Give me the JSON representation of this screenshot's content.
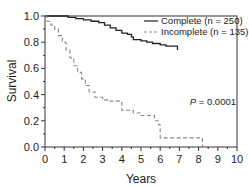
{
  "chart_data": {
    "type": "line",
    "subtype": "kaplan-meier step",
    "title": "",
    "xlabel": "Years",
    "ylabel": "Survival",
    "xlim": [
      0,
      10
    ],
    "ylim": [
      0.0,
      1.0
    ],
    "x_ticks": [
      "0",
      "1",
      "2",
      "3",
      "4",
      "5",
      "6",
      "7",
      "8",
      "9",
      "10"
    ],
    "y_ticks": [
      "0.0",
      "0.2",
      "0.4",
      "0.6",
      "0.8",
      "1.0"
    ],
    "grid": false,
    "legend_position": "upper right",
    "annotation": "P = 0.0001",
    "series": [
      {
        "name": "Complete (n = 250)",
        "style": "solid",
        "color": "#222222",
        "points": [
          [
            0,
            1.0
          ],
          [
            0.9,
            1.0
          ],
          [
            1.2,
            0.99
          ],
          [
            1.6,
            0.98
          ],
          [
            2.0,
            0.97
          ],
          [
            2.4,
            0.96
          ],
          [
            2.8,
            0.95
          ],
          [
            3.1,
            0.93
          ],
          [
            3.4,
            0.91
          ],
          [
            3.7,
            0.89
          ],
          [
            4.0,
            0.87
          ],
          [
            4.3,
            0.86
          ],
          [
            4.5,
            0.84
          ],
          [
            4.6,
            0.82
          ],
          [
            5.0,
            0.81
          ],
          [
            5.3,
            0.8
          ],
          [
            5.6,
            0.79
          ],
          [
            6.0,
            0.78
          ],
          [
            6.3,
            0.77
          ],
          [
            6.9,
            0.77
          ],
          [
            6.9,
            0.74
          ]
        ]
      },
      {
        "name": "Incomplete (n = 135)",
        "style": "dashed",
        "color": "#888888",
        "points": [
          [
            0,
            1.0
          ],
          [
            0.1,
            0.96
          ],
          [
            0.3,
            0.93
          ],
          [
            0.5,
            0.9
          ],
          [
            0.7,
            0.85
          ],
          [
            0.9,
            0.8
          ],
          [
            1.1,
            0.74
          ],
          [
            1.3,
            0.68
          ],
          [
            1.5,
            0.62
          ],
          [
            1.7,
            0.57
          ],
          [
            1.9,
            0.52
          ],
          [
            2.1,
            0.47
          ],
          [
            2.3,
            0.42
          ],
          [
            2.6,
            0.38
          ],
          [
            3.0,
            0.36
          ],
          [
            3.4,
            0.35
          ],
          [
            3.9,
            0.34
          ],
          [
            4.0,
            0.28
          ],
          [
            4.4,
            0.28
          ],
          [
            4.6,
            0.26
          ],
          [
            5.0,
            0.24
          ],
          [
            5.6,
            0.24
          ],
          [
            5.7,
            0.2
          ],
          [
            5.9,
            0.17
          ],
          [
            6.0,
            0.07
          ],
          [
            8.2,
            0.07
          ],
          [
            8.2,
            0.0
          ]
        ]
      }
    ]
  },
  "legend": {
    "items": [
      {
        "label": "Complete (n = 250)",
        "style": "solid"
      },
      {
        "label": "Incomplete (n = 135)",
        "style": "dashed"
      }
    ]
  },
  "labels": {
    "xlabel": "Years",
    "ylabel": "Survival",
    "pvalue": "P = 0.0001"
  }
}
